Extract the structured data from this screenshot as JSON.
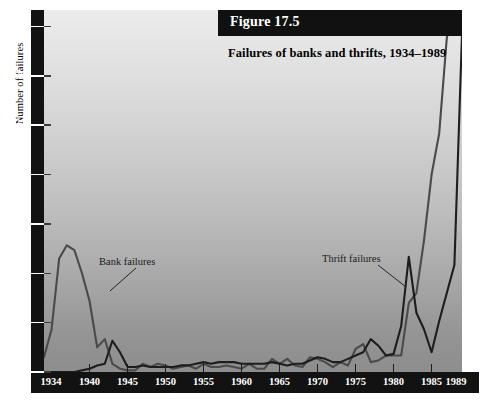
{
  "figure": {
    "number_label": "Figure 17.5",
    "title": "Failures of banks and thrifts, 1934–1989",
    "y_axis_title": "Number of failures"
  },
  "axes": {
    "y_ticks": [
      0,
      30,
      60,
      90,
      120,
      150,
      180,
      210
    ],
    "y_tick_labels": [
      "0",
      "30",
      "60",
      "90",
      "120",
      "150",
      "180",
      "210"
    ],
    "x_tick_labels": [
      "1934",
      "1940",
      "1945",
      "1950",
      "1955",
      "1960",
      "1965",
      "1970",
      "1975",
      "1980",
      "1985",
      "1989"
    ],
    "x_tick_years": [
      1934,
      1940,
      1945,
      1950,
      1955,
      1960,
      1965,
      1970,
      1975,
      1980,
      1985,
      1989
    ]
  },
  "annotations": {
    "bank": "Bank failures",
    "thrift": "Thrift failures"
  },
  "colors": {
    "axis_band": "#121212",
    "axis_text": "#ffffff",
    "plate": "#111111",
    "bank_line": "#4a4a4a",
    "thrift_line": "#1d1d1d",
    "plot_top": "#ececec",
    "plot_bottom": "#8d8d8d"
  },
  "chart_data": {
    "type": "line",
    "title": "Failures of banks and thrifts, 1934–1989",
    "xlabel": "",
    "ylabel": "Number of failures",
    "xlim": [
      1934,
      1989
    ],
    "ylim": [
      0,
      220
    ],
    "grid": false,
    "legend": "inline-annotations",
    "x": [
      1934,
      1935,
      1936,
      1937,
      1938,
      1939,
      1940,
      1941,
      1942,
      1943,
      1944,
      1945,
      1946,
      1947,
      1948,
      1949,
      1950,
      1951,
      1952,
      1953,
      1954,
      1955,
      1956,
      1957,
      1958,
      1959,
      1960,
      1961,
      1962,
      1963,
      1964,
      1965,
      1966,
      1967,
      1968,
      1969,
      1970,
      1971,
      1972,
      1973,
      1974,
      1975,
      1976,
      1977,
      1978,
      1979,
      1980,
      1981,
      1982,
      1983,
      1984,
      1985,
      1986,
      1987,
      1988,
      1989
    ],
    "series": [
      {
        "name": "Bank failures",
        "values": [
          9,
          26,
          69,
          77,
          74,
          60,
          43,
          15,
          20,
          5,
          2,
          1,
          1,
          5,
          3,
          5,
          4,
          2,
          3,
          4,
          2,
          5,
          3,
          3,
          4,
          3,
          2,
          5,
          2,
          2,
          8,
          5,
          8,
          4,
          3,
          9,
          8,
          6,
          3,
          6,
          4,
          14,
          17,
          6,
          7,
          10,
          10,
          10,
          42,
          48,
          80,
          120,
          145,
          203,
          221,
          207
        ]
      },
      {
        "name": "Thrift failures",
        "values": [
          0,
          0,
          0,
          0,
          0,
          1,
          2,
          4,
          5,
          19,
          12,
          3,
          3,
          4,
          3,
          3,
          3,
          3,
          4,
          4,
          5,
          6,
          5,
          6,
          6,
          6,
          5,
          5,
          5,
          5,
          6,
          5,
          4,
          5,
          5,
          7,
          9,
          8,
          6,
          6,
          8,
          10,
          12,
          20,
          16,
          10,
          11,
          28,
          70,
          36,
          26,
          12,
          31,
          48,
          65,
          205
        ]
      }
    ]
  }
}
